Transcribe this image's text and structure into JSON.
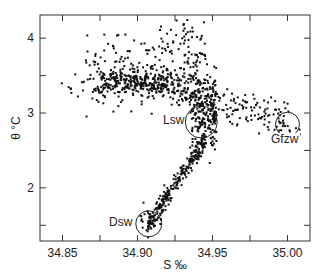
{
  "chart_data": {
    "type": "scatter",
    "title": "",
    "xlabel": "S ‰",
    "ylabel": "θ °C",
    "xlim": [
      34.835,
      35.015
    ],
    "ylim": [
      1.29,
      4.31
    ],
    "xticks": [
      34.85,
      34.9,
      34.95,
      35.0
    ],
    "xtick_labels": [
      "34.85",
      "34.90",
      "34.95",
      "35.00"
    ],
    "x_minor_ticks": [
      34.875,
      34.925,
      34.975
    ],
    "yticks": [
      2,
      3,
      4
    ],
    "ytick_labels": [
      "2",
      "3",
      "4"
    ],
    "y_minor_ticks": [
      1.5,
      2.5,
      3.5
    ],
    "grid": false,
    "legend": null,
    "marker": {
      "shape": "square",
      "size": 2,
      "color": "#111111"
    },
    "annotations": [
      {
        "label": "Lsw",
        "circle_center": [
          34.9425,
          2.88
        ],
        "circle_radius_px": 16,
        "label_pos": [
          34.917,
          2.86
        ],
        "label_anchor": "start"
      },
      {
        "label": "Gfzw",
        "circle_center": [
          35.0,
          2.85
        ],
        "circle_radius_px": 12,
        "label_pos": [
          34.989,
          2.6
        ],
        "label_anchor": "start"
      },
      {
        "label": "Dsw",
        "circle_center": [
          34.9075,
          1.52
        ],
        "circle_radius_px": 13,
        "label_pos": [
          34.881,
          1.49
        ],
        "label_anchor": "start"
      }
    ],
    "point_clusters": [
      {
        "name": "upper-band-dense",
        "n": 260,
        "x_range": [
          34.875,
          34.92
        ],
        "y_center": 3.42,
        "y_spread": 0.08,
        "trend": 0.0
      },
      {
        "name": "upper-band-spread",
        "n": 170,
        "x_range": [
          34.865,
          34.935
        ],
        "y_center": 3.6,
        "y_spread": 0.28,
        "trend": 1.0
      },
      {
        "name": "left-tail",
        "n": 20,
        "x_range": [
          34.843,
          34.875
        ],
        "y_center": 3.35,
        "y_spread": 0.08,
        "trend": 0.0
      },
      {
        "name": "upper-top",
        "n": 45,
        "x_range": [
          34.915,
          34.945
        ],
        "y_center": 3.95,
        "y_spread": 0.2,
        "trend": 0.0
      },
      {
        "name": "bend-vertical",
        "n": 230,
        "x_range": [
          34.935,
          34.952
        ],
        "y_center": 3.05,
        "y_spread": 0.3,
        "trend": 0.0
      },
      {
        "name": "bend-diagonal",
        "n": 120,
        "x_range": [
          34.92,
          34.95
        ],
        "y_center": 3.3,
        "y_spread": 0.12,
        "trend": -6.0
      },
      {
        "name": "right-branch",
        "n": 110,
        "x_range": [
          34.95,
          35.0
        ],
        "y_center": 3.05,
        "y_spread": 0.14,
        "trend": -5.0
      },
      {
        "name": "gfzw-cluster",
        "n": 12,
        "x_range": [
          34.993,
          35.008
        ],
        "y_center": 2.84,
        "y_spread": 0.1,
        "trend": 0.0
      },
      {
        "name": "lower-branch",
        "n": 260,
        "x_range": [
          34.906,
          34.945
        ],
        "y_center": 2.1,
        "y_spread": 0.07,
        "trend": 30.0
      },
      {
        "name": "dsw-cluster",
        "n": 22,
        "x_range": [
          34.901,
          34.915
        ],
        "y_center": 1.56,
        "y_spread": 0.1,
        "trend": 0.0
      }
    ],
    "lower_branch_anchor": {
      "x": 34.9075,
      "y": 1.55
    }
  }
}
